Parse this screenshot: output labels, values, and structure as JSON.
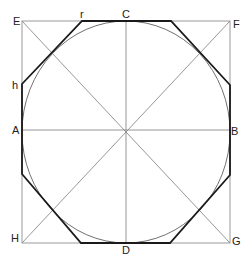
{
  "diagram": {
    "colors": {
      "square": "#9a9a9a",
      "guides": "#8a8a8a",
      "circle": "#707070",
      "octagon": "#1a1a1a",
      "labels": "#222222"
    },
    "labels": {
      "E": "E",
      "F": "F",
      "G": "G",
      "H": "H",
      "A": "A",
      "B": "B",
      "C": "C",
      "D": "D",
      "h": "h",
      "r": "r"
    }
  }
}
